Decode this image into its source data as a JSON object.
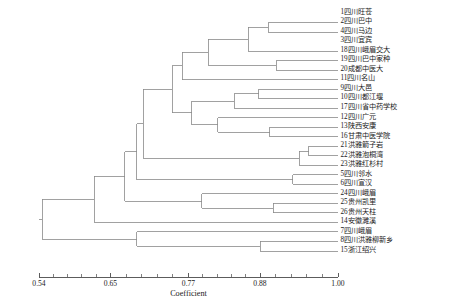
{
  "figure": {
    "kind": "dendrogram",
    "axis_title": "Coefficient"
  },
  "axis": {
    "title": "Coefficient",
    "ticks": [
      "0.54",
      "0.65",
      "0.77",
      "0.88",
      "1.00"
    ],
    "tick_values": [
      0.54,
      0.65,
      0.77,
      0.88,
      1.0
    ],
    "min": 0.54,
    "max": 1.0,
    "minor_ticks_per_interval": 5
  },
  "chart_data": {
    "type": "line",
    "title": "",
    "subtitle": "",
    "xlabel": "Coefficient",
    "ylabel": "",
    "xlim": [
      0.54,
      1.0
    ],
    "grid": false,
    "legend": "none",
    "leaves": [
      {
        "order": 1,
        "id": "1",
        "name": "1四川旺苍",
        "merge_coefficient": 1.0
      },
      {
        "order": 2,
        "id": "2",
        "name": "2四川巴中",
        "merge_coefficient": 1.0
      },
      {
        "order": 3,
        "id": "4",
        "name": "4四川马边",
        "merge_coefficient": 1.0
      },
      {
        "order": 4,
        "id": "3",
        "name": "3四川宜宾",
        "merge_coefficient": 1.0
      },
      {
        "order": 5,
        "id": "18",
        "name": "18四川峨眉交大",
        "merge_coefficient": 1.0
      },
      {
        "order": 6,
        "id": "19",
        "name": "19四川巴中家种",
        "merge_coefficient": 1.0
      },
      {
        "order": 7,
        "id": "20",
        "name": "20成都中医大",
        "merge_coefficient": 1.0
      },
      {
        "order": 8,
        "id": "11",
        "name": "11四川名山",
        "merge_coefficient": 1.0
      },
      {
        "order": 9,
        "id": "9",
        "name": "9四川大邑",
        "merge_coefficient": 1.0
      },
      {
        "order": 10,
        "id": "10",
        "name": "10四川都江堰",
        "merge_coefficient": 1.0
      },
      {
        "order": 11,
        "id": "17",
        "name": "17四川省中药学校",
        "merge_coefficient": 1.0
      },
      {
        "order": 12,
        "id": "12",
        "name": "12四川广元",
        "merge_coefficient": 1.0
      },
      {
        "order": 13,
        "id": "13",
        "name": "13陕西安康",
        "merge_coefficient": 1.0
      },
      {
        "order": 14,
        "id": "16",
        "name": "16甘肃中医学院",
        "merge_coefficient": 1.0
      },
      {
        "order": 15,
        "id": "21",
        "name": "21洪雅箭子岩",
        "merge_coefficient": 1.0
      },
      {
        "order": 16,
        "id": "22",
        "name": "22洪雅泡桐湾",
        "merge_coefficient": 1.0
      },
      {
        "order": 17,
        "id": "23",
        "name": "23洪雅红杉村",
        "merge_coefficient": 1.0
      },
      {
        "order": 18,
        "id": "5",
        "name": "5四川邻水",
        "merge_coefficient": 1.0
      },
      {
        "order": 19,
        "id": "6",
        "name": "6四川宣汉",
        "merge_coefficient": 1.0
      },
      {
        "order": 20,
        "id": "24",
        "name": "24四川峨眉",
        "merge_coefficient": 1.0
      },
      {
        "order": 21,
        "id": "25",
        "name": "25贵州凯里",
        "merge_coefficient": 1.0
      },
      {
        "order": 22,
        "id": "26",
        "name": "26贵州天柱",
        "merge_coefficient": 1.0
      },
      {
        "order": 23,
        "id": "14",
        "name": "14安徽濉溪",
        "merge_coefficient": 1.0
      },
      {
        "order": 24,
        "id": "7",
        "name": "7四川峨眉",
        "merge_coefficient": 1.0
      },
      {
        "order": 25,
        "id": "8",
        "name": "8四川洪雅柳新乡",
        "merge_coefficient": 1.0
      },
      {
        "order": 26,
        "id": "15",
        "name": "15浙江绍兴",
        "merge_coefficient": 1.0
      }
    ],
    "merges": [
      {
        "node": "n1",
        "coefficient": 0.893,
        "children": [
          "2",
          "4"
        ]
      },
      {
        "node": "n2",
        "coefficient": 0.862,
        "children": [
          "18",
          "n1"
        ]
      },
      {
        "node": "n3",
        "coefficient": 0.905,
        "children": [
          "19",
          "20"
        ]
      },
      {
        "node": "n4",
        "coefficient": 0.8,
        "children": [
          "n2",
          "n3"
        ]
      },
      {
        "node": "n5",
        "coefficient": 0.76,
        "children": [
          "n4",
          "11"
        ]
      },
      {
        "node": "n6",
        "coefficient": 0.878,
        "children": [
          "9",
          "10"
        ]
      },
      {
        "node": "n7",
        "coefficient": 0.84,
        "children": [
          "n6",
          "17"
        ]
      },
      {
        "node": "n8",
        "coefficient": 0.895,
        "children": [
          "13",
          "16"
        ]
      },
      {
        "node": "n9",
        "coefficient": 0.815,
        "children": [
          "12",
          "n8"
        ]
      },
      {
        "node": "n10",
        "coefficient": 0.775,
        "children": [
          "n7",
          "n9"
        ]
      },
      {
        "node": "n11",
        "coefficient": 0.745,
        "children": [
          "n5",
          "n10"
        ]
      },
      {
        "node": "n12",
        "coefficient": 0.955,
        "children": [
          "21",
          "22"
        ]
      },
      {
        "node": "n13",
        "coefficient": 0.94,
        "children": [
          "n12",
          "23"
        ]
      },
      {
        "node": "n14",
        "coefficient": 0.7,
        "children": [
          "n11",
          "n13"
        ]
      },
      {
        "node": "n15",
        "coefficient": 0.93,
        "children": [
          "5",
          "6"
        ]
      },
      {
        "node": "n16",
        "coefficient": 0.9,
        "children": [
          "25",
          "26"
        ]
      },
      {
        "node": "n17",
        "coefficient": 0.79,
        "children": [
          "24",
          "n16"
        ]
      },
      {
        "node": "n18",
        "coefficient": 0.69,
        "children": [
          "n14",
          "n15"
        ]
      },
      {
        "node": "n19",
        "coefficient": 0.672,
        "children": [
          "n18",
          "n17"
        ]
      },
      {
        "node": "n20",
        "coefficient": 0.625,
        "children": [
          "n19",
          "14"
        ]
      },
      {
        "node": "n21",
        "coefficient": 0.88,
        "children": [
          "8",
          "15"
        ]
      },
      {
        "node": "n22",
        "coefficient": 0.69,
        "children": [
          "7",
          "n21"
        ]
      },
      {
        "node": "root",
        "coefficient": 0.545,
        "children": [
          "n20",
          "n22"
        ]
      }
    ]
  }
}
